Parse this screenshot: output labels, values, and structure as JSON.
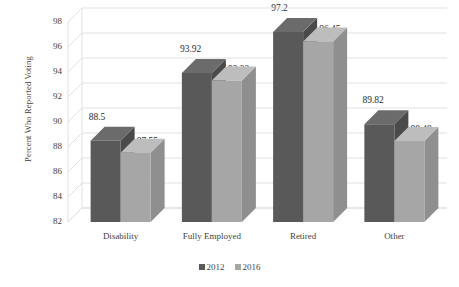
{
  "chart_data": {
    "type": "bar",
    "title": "",
    "xlabel": "",
    "ylabel": "Percent Who Reported Voting",
    "ylim": [
      82,
      98
    ],
    "ytick_step": 2,
    "grid": true,
    "three_d": true,
    "legend_position": "bottom",
    "categories": [
      "Disability",
      "Fully Employed",
      "Retired",
      "Other"
    ],
    "yticks": [
      "82",
      "84",
      "86",
      "88",
      "90",
      "92",
      "94",
      "96",
      "98"
    ],
    "series": [
      {
        "name": "2012",
        "color": "#595959",
        "values": [
          88.5,
          93.92,
          97.2,
          89.82
        ],
        "labels": [
          "88.5",
          "93.92",
          "97.2",
          "89.82"
        ]
      },
      {
        "name": "2016",
        "color": "#a6a6a6",
        "values": [
          87.55,
          93.32,
          96.45,
          88.48
        ],
        "labels": [
          "87.55",
          "93.32",
          "96.45",
          "88.48"
        ]
      }
    ]
  },
  "colors": {
    "series_2012": "#595959",
    "series_2016": "#a6a6a6",
    "series_2012_side": "#4a4a4a",
    "series_2016_side": "#8f8f8f",
    "series_2012_top": "#6b6b6b",
    "series_2016_top": "#bdbdbd",
    "gridline": "#d9d9d9",
    "text": "#3f3f3f",
    "background": "#ffffff"
  }
}
